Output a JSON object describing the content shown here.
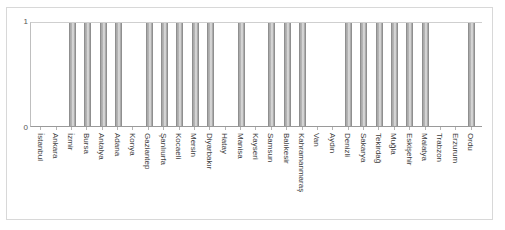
{
  "chart_data": {
    "type": "bar",
    "title": "",
    "subtitle": "",
    "xlabel": "",
    "ylabel": "",
    "ylim": [
      0,
      1
    ],
    "ytick_labels": [
      "0",
      "1"
    ],
    "grid": false,
    "legend": null,
    "bar_color": "#b9b9b9",
    "bar_edge_color": "#8f8f8f",
    "categories": [
      "İstanbul",
      "Ankara",
      "İzmir",
      "Bursa",
      "Antalya",
      "Adana",
      "Konya",
      "Gaziantep",
      "Şanlıurfa",
      "Kocaeli",
      "Mersin",
      "Diyarbakır",
      "Hatay",
      "Manisa",
      "Kayseri",
      "Samsun",
      "Balıkesir",
      "Kahramanmaraş",
      "Van",
      "Aydın",
      "Denizli",
      "Sakarya",
      "Tekirdağ",
      "Muğla",
      "Eskişehir",
      "Malatya",
      "Trabzon",
      "Erzurum",
      "Ordu"
    ],
    "values": [
      0,
      0,
      1,
      1,
      1,
      1,
      0,
      1,
      1,
      1,
      1,
      1,
      0,
      1,
      0,
      1,
      1,
      1,
      0,
      0,
      1,
      1,
      1,
      1,
      1,
      1,
      0,
      0,
      1
    ]
  }
}
